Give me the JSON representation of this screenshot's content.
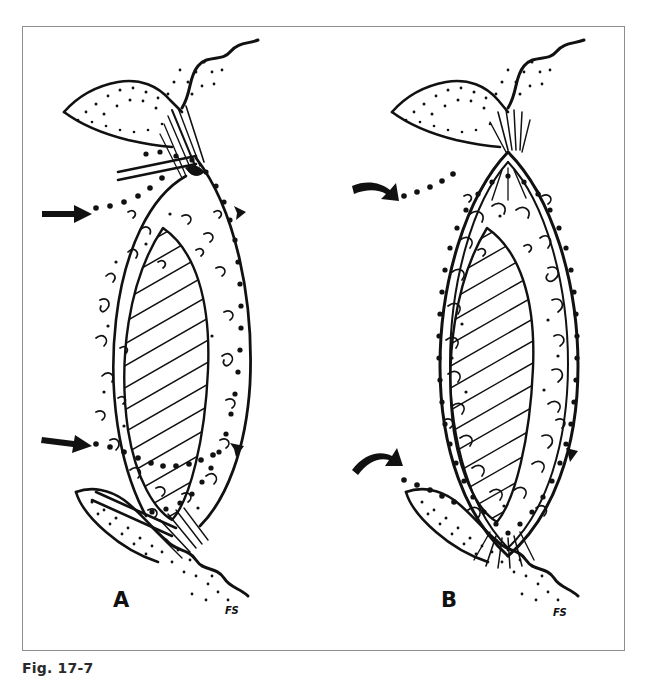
{
  "figure": {
    "caption": "Fig. 17-7",
    "panels": [
      {
        "id": "A",
        "label": "A",
        "signature": "FS",
        "condition": "detached / torn attachment with dispersed joint contents"
      },
      {
        "id": "B",
        "label": "B",
        "signature": "FS",
        "condition": "intact attachment with contained joint contents"
      }
    ]
  },
  "colors": {
    "frame_border": "#8d8d8d",
    "ink": "#111111",
    "background": "#ffffff"
  }
}
